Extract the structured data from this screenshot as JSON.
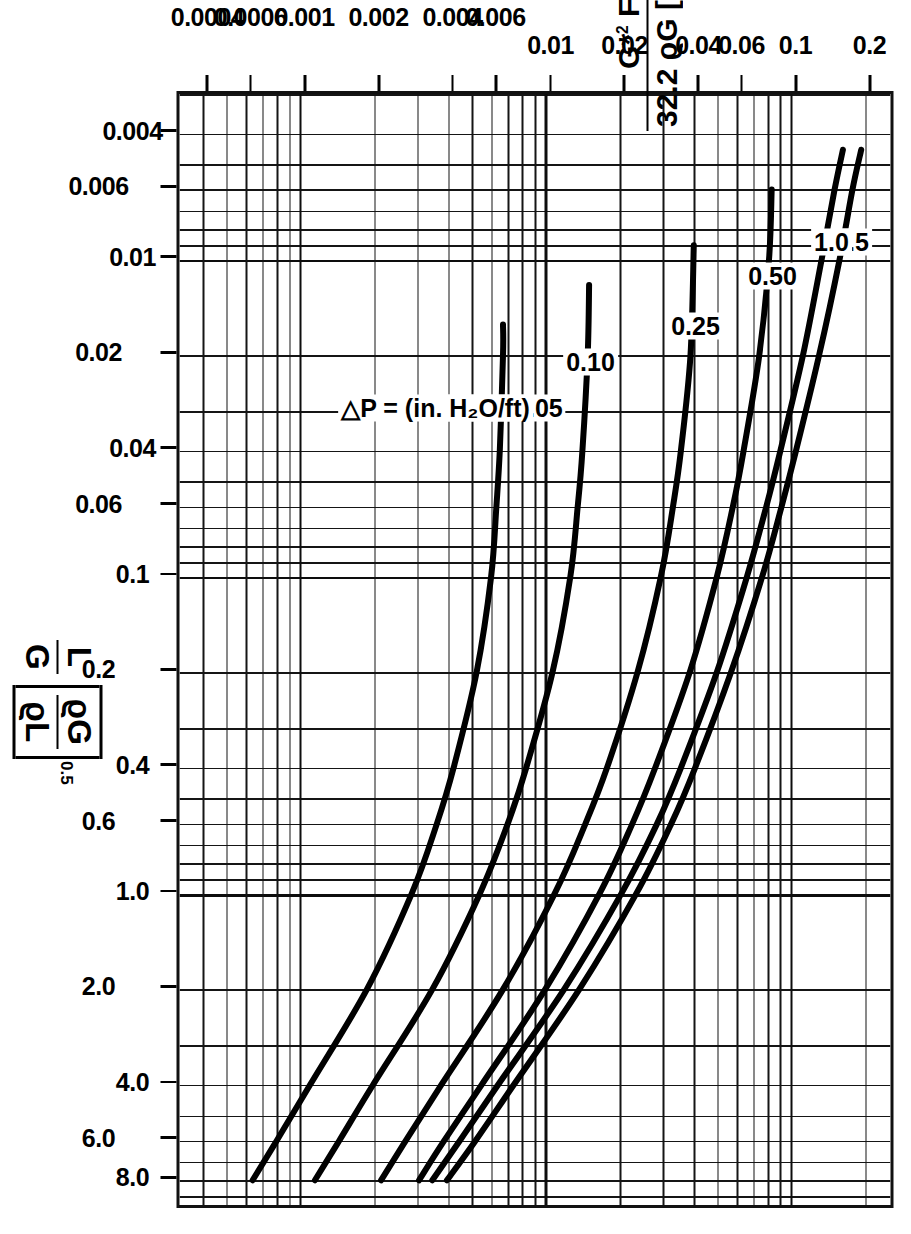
{
  "figure": {
    "kind": "generalized-pressure-drop-correlation",
    "orientation_deg": 90,
    "background": "#ffffff",
    "ink": "#000000"
  },
  "axes": {
    "x": {
      "title_parts": {
        "lead_num": "L",
        "lead_den": "G",
        "bracket_num": "ϱG",
        "bracket_den": "ϱL",
        "exponent": "0.5"
      },
      "scale": "log",
      "min": 0.003,
      "max": 10,
      "ticks": [
        "0.004",
        "0.006",
        "0.01",
        "0.02",
        "0.04",
        "0.06",
        "0.1",
        "0.2",
        "0.4",
        "0.6",
        "1.0",
        "2.0",
        "4.0",
        "6.0",
        "8.0"
      ],
      "tick_values": [
        0.004,
        0.006,
        0.01,
        0.02,
        0.04,
        0.06,
        0.1,
        0.2,
        0.4,
        0.6,
        1.0,
        2.0,
        4.0,
        6.0,
        8.0
      ]
    },
    "y": {
      "title_parts": {
        "num_G": "G",
        "num_star": "*",
        "num_sq": "2",
        "num_F": "F",
        "num_nu": "ν",
        "num_exp": "0.1",
        "den_const": "32.2",
        "den_rhoG": "ϱG",
        "den_brk_open": "[",
        "den_rhoL": "ϱL",
        "den_minus": "−",
        "den_rhoG2": "ϱG",
        "den_brk_close": "]"
      },
      "scale": "log",
      "min": 0.0003,
      "max": 0.25,
      "ticks": [
        "0.2",
        "0.1",
        "0.06",
        "0.04",
        "0.02",
        "0.01",
        "0.006",
        "0.004",
        "0.002",
        "0.001",
        "0.0006",
        "0.0004"
      ],
      "tick_values": [
        0.2,
        0.1,
        0.06,
        0.04,
        0.02,
        0.01,
        0.006,
        0.004,
        0.002,
        0.001,
        0.0006,
        0.0004
      ]
    }
  },
  "annotations": {
    "dp_named": "△P = 0.05",
    "dp_units": "△P = (in. H₂O/ft)"
  },
  "chart_data": {
    "type": "line",
    "title": "",
    "xlabel": "L/G [ϱG/ϱL]^0.5",
    "ylabel": "G*² F ν^0.1 / (32.2 ϱG [ϱL − ϱG])",
    "xscale": "log",
    "yscale": "log",
    "xlim": [
      0.003,
      10
    ],
    "ylim": [
      0.0003,
      0.25
    ],
    "grid": true,
    "legend": "inline-curve-labels",
    "curve_label_units": "△P in inches H2O per foot of packing",
    "series": [
      {
        "name": "1.5",
        "label": "1.5",
        "points": [
          [
            0.0045,
            0.19
          ],
          [
            0.006,
            0.175
          ],
          [
            0.01,
            0.155
          ],
          [
            0.02,
            0.128
          ],
          [
            0.04,
            0.103
          ],
          [
            0.06,
            0.09
          ],
          [
            0.1,
            0.075
          ],
          [
            0.2,
            0.056
          ],
          [
            0.4,
            0.04
          ],
          [
            0.6,
            0.032
          ],
          [
            1.0,
            0.023
          ],
          [
            2.0,
            0.0135
          ],
          [
            4.0,
            0.0073
          ],
          [
            6.0,
            0.0051
          ],
          [
            8.0,
            0.0039
          ]
        ]
      },
      {
        "name": "1.0",
        "label": "1.0",
        "points": [
          [
            0.0045,
            0.16
          ],
          [
            0.006,
            0.148
          ],
          [
            0.01,
            0.131
          ],
          [
            0.02,
            0.11
          ],
          [
            0.04,
            0.089
          ],
          [
            0.06,
            0.078
          ],
          [
            0.1,
            0.065
          ],
          [
            0.2,
            0.049
          ],
          [
            0.4,
            0.035
          ],
          [
            0.6,
            0.028
          ],
          [
            1.0,
            0.02
          ],
          [
            2.0,
            0.0117
          ],
          [
            4.0,
            0.0063
          ],
          [
            6.0,
            0.0044
          ],
          [
            8.0,
            0.0034
          ]
        ]
      },
      {
        "name": "0.50",
        "label": "0.50",
        "points": [
          [
            0.006,
            0.082
          ],
          [
            0.01,
            0.08
          ],
          [
            0.02,
            0.073
          ],
          [
            0.04,
            0.063
          ],
          [
            0.06,
            0.057
          ],
          [
            0.1,
            0.049
          ],
          [
            0.2,
            0.038
          ],
          [
            0.4,
            0.0275
          ],
          [
            0.6,
            0.0222
          ],
          [
            1.0,
            0.0163
          ],
          [
            2.0,
            0.0098
          ],
          [
            4.0,
            0.0054
          ],
          [
            6.0,
            0.0038
          ],
          [
            8.0,
            0.003
          ]
        ]
      },
      {
        "name": "0.25",
        "label": "0.25",
        "points": [
          [
            0.009,
            0.0395
          ],
          [
            0.02,
            0.0383
          ],
          [
            0.04,
            0.035
          ],
          [
            0.06,
            0.0325
          ],
          [
            0.1,
            0.029
          ],
          [
            0.2,
            0.0233
          ],
          [
            0.4,
            0.0175
          ],
          [
            0.6,
            0.0143
          ],
          [
            1.0,
            0.0107
          ],
          [
            2.0,
            0.0066
          ],
          [
            4.0,
            0.0037
          ],
          [
            6.0,
            0.00265
          ],
          [
            8.0,
            0.0021
          ]
        ]
      },
      {
        "name": "0.10",
        "label": "0.10",
        "points": [
          [
            0.012,
            0.0148
          ],
          [
            0.02,
            0.0146
          ],
          [
            0.04,
            0.0139
          ],
          [
            0.06,
            0.0133
          ],
          [
            0.1,
            0.0124
          ],
          [
            0.2,
            0.0105
          ],
          [
            0.4,
            0.0082
          ],
          [
            0.6,
            0.0069
          ],
          [
            1.0,
            0.0053
          ],
          [
            2.0,
            0.0034
          ],
          [
            4.0,
            0.00195
          ],
          [
            6.0,
            0.00142
          ],
          [
            8.0,
            0.00113
          ]
        ]
      },
      {
        "name": "0.05",
        "label": "△P = 0.05",
        "points": [
          [
            0.016,
            0.0066
          ],
          [
            0.02,
            0.0066
          ],
          [
            0.04,
            0.0064
          ],
          [
            0.06,
            0.0062
          ],
          [
            0.1,
            0.0059
          ],
          [
            0.2,
            0.00515
          ],
          [
            0.4,
            0.00415
          ],
          [
            0.6,
            0.00355
          ],
          [
            1.0,
            0.0028
          ],
          [
            2.0,
            0.00184
          ],
          [
            4.0,
            0.00108
          ],
          [
            6.0,
            0.00079
          ],
          [
            8.0,
            0.00063
          ]
        ]
      }
    ]
  }
}
